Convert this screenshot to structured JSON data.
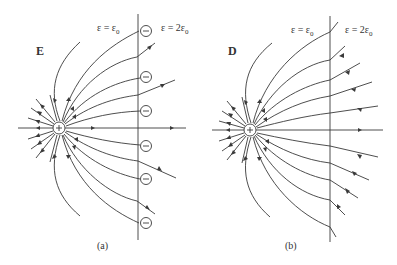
{
  "figure": {
    "panels": [
      {
        "id": "a",
        "field_symbol": "E",
        "caption": "(a)",
        "left_region": {
          "eps": "ε = ε",
          "sub": "0"
        },
        "right_region": {
          "eps": "ε = 2ε",
          "sub": "0"
        },
        "charge": {
          "x": 59,
          "y": 128,
          "sign": "+"
        },
        "interface_x": 138,
        "interface_y": [
          14,
          240
        ],
        "surface_charges": [
          {
            "x": 146,
            "y": 31,
            "sign": "−"
          },
          {
            "x": 146,
            "y": 77,
            "sign": "−"
          },
          {
            "x": 146,
            "y": 111,
            "sign": "−"
          },
          {
            "x": 146,
            "y": 146,
            "sign": "−"
          },
          {
            "x": 146,
            "y": 179,
            "sign": "−"
          },
          {
            "x": 146,
            "y": 223,
            "sign": "−"
          }
        ]
      },
      {
        "id": "b",
        "field_symbol": "D",
        "caption": "(b)",
        "left_region": {
          "eps": "ε = ε",
          "sub": "0"
        },
        "right_region": {
          "eps": "ε = 2ε",
          "sub": "0"
        },
        "charge": {
          "x": 250,
          "y": 130,
          "sign": "+"
        },
        "interface_x": 330,
        "interface_y": [
          16,
          242
        ],
        "surface_charges": []
      }
    ]
  },
  "labels": {
    "a_symbol": "E",
    "b_symbol": "D",
    "a_left_eps": "ε = ε",
    "a_right_eps": "ε = 2ε",
    "b_left_eps": "ε = ε",
    "b_right_eps": "ε = 2ε",
    "sub0": "0",
    "a_caption": "(a)",
    "b_caption": "(b)",
    "plus": "+",
    "minus": "−"
  },
  "colors": {
    "line": "#3a3a3a",
    "text": "#333333",
    "background": "#ffffff"
  }
}
